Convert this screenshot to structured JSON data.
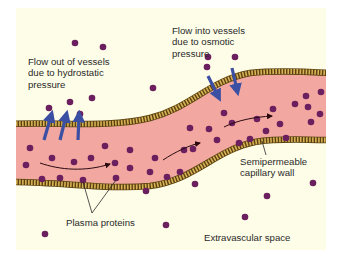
{
  "figure": {
    "background_color": "#fefde8",
    "vessel_fill": "#f2a8a0",
    "wall_color": "#c9a04a",
    "wall_dark": "#5a4210",
    "protein_color": "#6b1f5e",
    "arrow_blue": "#3b4fa3",
    "flow_arrow_color": "#2a0a10"
  },
  "labels": {
    "flow_out": "Flow out of vessels\ndue to hydrostatic\npressure",
    "flow_in": "Flow into vessels\ndue to osmotic\npressure",
    "semipermeable": "Semipermeable\ncapillary wall",
    "plasma_proteins": "Plasma proteins",
    "extravascular": "Extravascular space"
  },
  "proteins_outside": [
    [
      75,
      43
    ],
    [
      103,
      47
    ],
    [
      153,
      88
    ],
    [
      49,
      108
    ],
    [
      70,
      102
    ],
    [
      92,
      98
    ],
    [
      80,
      114
    ],
    [
      208,
      57
    ],
    [
      235,
      57
    ],
    [
      207,
      67
    ],
    [
      45,
      234
    ],
    [
      166,
      225
    ],
    [
      195,
      184
    ],
    [
      267,
      196
    ],
    [
      313,
      183
    ],
    [
      245,
      217
    ]
  ],
  "proteins_inside": [
    [
      30,
      148
    ],
    [
      26,
      165
    ],
    [
      52,
      158
    ],
    [
      74,
      162
    ],
    [
      91,
      158
    ],
    [
      105,
      146
    ],
    [
      115,
      163
    ],
    [
      42,
      179
    ],
    [
      60,
      178
    ],
    [
      83,
      180
    ],
    [
      116,
      178
    ],
    [
      130,
      168
    ],
    [
      130,
      150
    ],
    [
      150,
      172
    ],
    [
      155,
      158
    ],
    [
      146,
      191
    ],
    [
      167,
      177
    ],
    [
      180,
      172
    ],
    [
      184,
      150
    ],
    [
      193,
      149
    ],
    [
      209,
      129
    ],
    [
      217,
      140
    ],
    [
      190,
      128
    ],
    [
      224,
      113
    ],
    [
      232,
      123
    ],
    [
      239,
      143
    ],
    [
      250,
      139
    ],
    [
      257,
      119
    ],
    [
      266,
      131
    ],
    [
      273,
      109
    ],
    [
      280,
      124
    ],
    [
      286,
      138
    ],
    [
      295,
      104
    ],
    [
      308,
      107
    ],
    [
      311,
      122
    ],
    [
      306,
      96
    ],
    [
      321,
      92
    ],
    [
      320,
      114
    ]
  ]
}
